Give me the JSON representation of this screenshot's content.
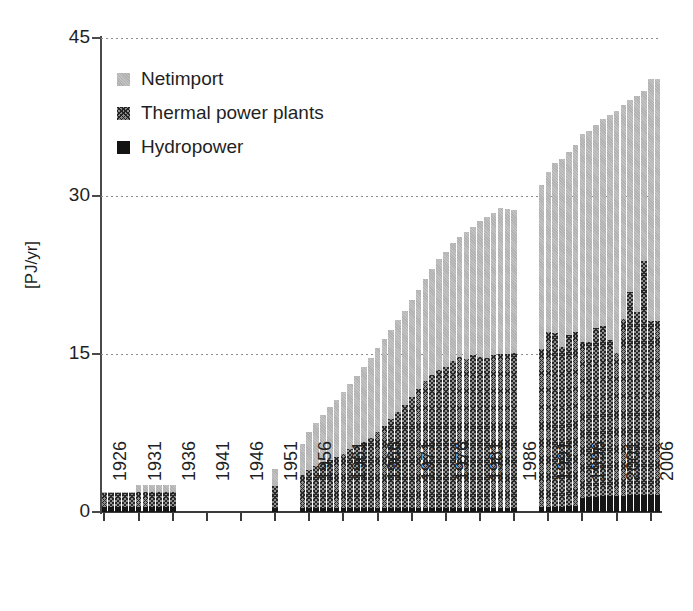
{
  "chart_data": {
    "type": "bar",
    "stacked": true,
    "title": "",
    "subtitle": "",
    "xlabel": "",
    "ylabel": "[PJ/yr]",
    "ylim": [
      0,
      45
    ],
    "yticks": [
      0,
      15,
      30,
      45
    ],
    "ytick_labels": [
      "0",
      "15",
      "30",
      "45"
    ],
    "grid": "horizontal-dotted",
    "xlim": [
      1926,
      2007
    ],
    "xticks": [
      1926,
      1931,
      1936,
      1941,
      1946,
      1951,
      1956,
      1961,
      1966,
      1971,
      1976,
      1981,
      1986,
      1991,
      1996,
      2001,
      2006
    ],
    "xtick_labels": [
      "1926",
      "1931",
      "1936",
      "1941",
      "1946",
      "1951",
      "1956",
      "1961",
      "1966",
      "1971",
      "1976",
      "1981",
      "1986",
      "1991",
      "1996",
      "2001",
      "2006"
    ],
    "legend_position": "top-left",
    "legend_entries": [
      "Netimport",
      "Thermal power plants",
      "Hydropower"
    ],
    "colors": {
      "netimport": "#c3c3c3",
      "thermal": "#5a5a5a",
      "hydropower": "#151515",
      "axis": "#3a3a3a",
      "grid": "#8d8d8d",
      "background": "#ffffff",
      "text": "#1f1f1f"
    },
    "missing_years": [
      1937,
      1938,
      1939,
      1940,
      1941,
      1942,
      1943,
      1944,
      1945,
      1946,
      1947,
      1948,
      1949,
      1950,
      1952,
      1953,
      1954,
      1987,
      1988,
      1989
    ],
    "x": [
      1926,
      1927,
      1928,
      1929,
      1930,
      1931,
      1932,
      1933,
      1934,
      1935,
      1936,
      1951,
      1955,
      1956,
      1957,
      1958,
      1959,
      1960,
      1961,
      1962,
      1963,
      1964,
      1965,
      1966,
      1967,
      1968,
      1969,
      1970,
      1971,
      1972,
      1973,
      1974,
      1975,
      1976,
      1977,
      1978,
      1979,
      1980,
      1981,
      1982,
      1983,
      1984,
      1985,
      1986,
      1990,
      1991,
      1992,
      1993,
      1994,
      1995,
      1996,
      1997,
      1998,
      1999,
      2000,
      2001,
      2002,
      2003,
      2004,
      2005,
      2006,
      2007
    ],
    "series": [
      {
        "name": "Hydropower",
        "key": "hydropower",
        "values": [
          0.45,
          0.45,
          0.45,
          0.45,
          0.45,
          0.5,
          0.5,
          0.5,
          0.5,
          0.5,
          0.5,
          0.35,
          0.35,
          0.35,
          0.35,
          0.35,
          0.35,
          0.35,
          0.35,
          0.35,
          0.35,
          0.35,
          0.35,
          0.35,
          0.4,
          0.4,
          0.4,
          0.4,
          0.4,
          0.4,
          0.4,
          0.4,
          0.4,
          0.4,
          0.4,
          0.4,
          0.4,
          0.4,
          0.4,
          0.4,
          0.4,
          0.4,
          0.4,
          0.4,
          0.5,
          0.5,
          0.5,
          0.5,
          0.6,
          0.6,
          1.3,
          1.4,
          1.4,
          1.5,
          1.5,
          1.5,
          1.5,
          1.6,
          1.6,
          1.6,
          1.6,
          1.6
        ]
      },
      {
        "name": "Thermal power plants",
        "key": "thermal",
        "values": [
          1.35,
          1.35,
          1.35,
          1.35,
          1.35,
          1.4,
          1.4,
          1.4,
          1.4,
          1.4,
          1.4,
          2.1,
          3.2,
          3.6,
          4.0,
          4.3,
          4.6,
          4.9,
          5.2,
          5.6,
          6.0,
          6.3,
          6.7,
          7.2,
          7.8,
          8.4,
          9.1,
          9.8,
          10.5,
          11.3,
          12.0,
          12.6,
          13.1,
          13.4,
          13.9,
          14.3,
          14.1,
          14.5,
          14.3,
          14.2,
          14.5,
          14.6,
          14.6,
          14.7,
          15.0,
          16.6,
          16.5,
          15.2,
          16.2,
          16.5,
          14.8,
          14.7,
          16.1,
          16.2,
          14.8,
          13.6,
          16.8,
          19.3,
          17.4,
          22.2,
          16.5,
          16.5
        ]
      },
      {
        "name": "Netimport",
        "key": "netimport",
        "values": [
          0.1,
          0.1,
          0.1,
          0.1,
          0.1,
          0.7,
          0.7,
          0.7,
          0.7,
          0.7,
          0.7,
          1.6,
          2.9,
          3.6,
          4.1,
          4.6,
          5.0,
          5.4,
          5.8,
          6.2,
          6.6,
          7.1,
          7.6,
          8.0,
          8.2,
          8.5,
          8.7,
          8.9,
          9.2,
          9.4,
          9.7,
          10.1,
          10.5,
          10.9,
          11.2,
          11.4,
          12.1,
          12.2,
          12.9,
          13.4,
          13.5,
          13.9,
          13.8,
          13.6,
          15.5,
          15.2,
          16.1,
          17.8,
          17.4,
          17.7,
          19.8,
          20.1,
          19.2,
          19.6,
          21.4,
          23.0,
          20.3,
          18.2,
          20.5,
          16.2,
          23.0,
          23.0
        ]
      }
    ]
  }
}
